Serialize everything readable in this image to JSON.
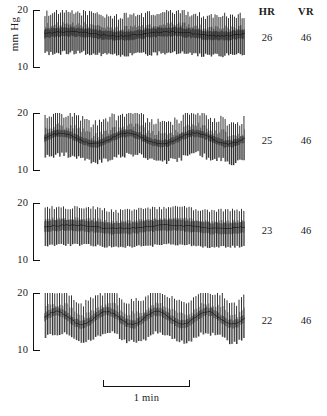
{
  "axis": {
    "unit_label": "mm Hg",
    "tick_top": "20",
    "tick_bottom": "10"
  },
  "columns": {
    "hr_header": "HR",
    "vr_header": "VR"
  },
  "scale_bar": {
    "label": "1 min"
  },
  "chart_data": {
    "type": "line",
    "title": "",
    "xlabel": "1 min",
    "ylabel": "mm Hg",
    "ylim": [
      10,
      20
    ],
    "yticks": [
      10,
      20
    ],
    "grid": false,
    "legend": null,
    "panels": [
      {
        "index": 1,
        "hr": "26",
        "vr": "46",
        "pulse_count": 104,
        "mean_pressure": 15.8,
        "systolic_mean": 19.3,
        "diastolic_mean": 12.4,
        "band_center": 15.9,
        "band_thickness": 1.5,
        "slow_wave_amplitude": 0.35,
        "slow_wave_cycles": 2.0,
        "noise": 0.55,
        "density": "very-high"
      },
      {
        "index": 2,
        "hr": "25",
        "vr": "46",
        "pulse_count": 96,
        "mean_pressure": 15.6,
        "systolic_mean": 19.2,
        "diastolic_mean": 12.2,
        "band_center": 15.6,
        "band_thickness": 1.2,
        "slow_wave_amplitude": 0.9,
        "slow_wave_cycles": 3.0,
        "noise": 0.7,
        "density": "high"
      },
      {
        "index": 3,
        "hr": "23",
        "vr": "46",
        "pulse_count": 88,
        "mean_pressure": 15.7,
        "systolic_mean": 19.0,
        "diastolic_mean": 12.6,
        "band_center": 15.9,
        "band_thickness": 1.9,
        "slow_wave_amplitude": 0.3,
        "slow_wave_cycles": 2.0,
        "noise": 0.3,
        "density": "uniform"
      },
      {
        "index": 4,
        "hr": "22",
        "vr": "46",
        "pulse_count": 84,
        "mean_pressure": 15.7,
        "systolic_mean": 19.4,
        "diastolic_mean": 12.3,
        "band_center": 15.7,
        "band_thickness": 1.4,
        "slow_wave_amplitude": 1.1,
        "slow_wave_cycles": 4.0,
        "noise": 0.45,
        "density": "medium"
      }
    ]
  },
  "geometry": {
    "panel_tops": [
      10,
      113,
      203,
      293
    ],
    "panel_height": 58,
    "trace_left": 44,
    "trace_width": 201,
    "scalebar": {
      "left": 103,
      "top": 380,
      "width": 87,
      "height": 7
    },
    "scalebar_label_top": 392,
    "header_top": 6,
    "ink_color": "#111111"
  }
}
